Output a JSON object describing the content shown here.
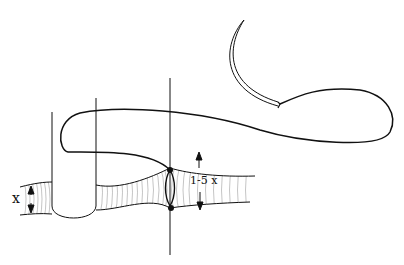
{
  "figure": {
    "labels": {
      "left_diameter": "x",
      "right_diameter": "1-5 x"
    },
    "colors": {
      "ink": "#111111",
      "hatch": "#8a8a8a",
      "background": "#ffffff"
    },
    "elements": [
      "curved-needle",
      "suture-thread",
      "vessel",
      "vessel-clamp",
      "needle-shaft-line",
      "diameter-arrows"
    ]
  }
}
